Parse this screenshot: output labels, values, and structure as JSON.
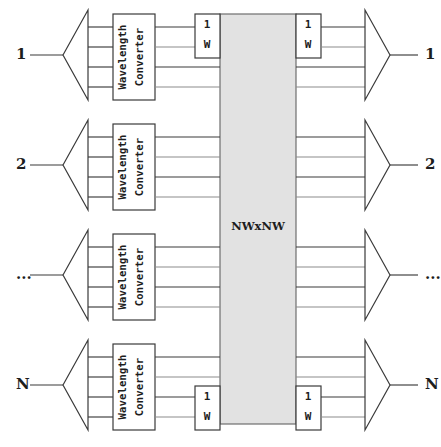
{
  "diagram": {
    "fabric": {
      "label": "NWxNW",
      "fill_color": "#e2e2e2",
      "stroke_color": "#6e6e6e"
    },
    "converter": {
      "line1": "Wavelength",
      "line2": "Converter"
    },
    "amplifier": {
      "line1": "1",
      "line2": "W"
    },
    "colors": {
      "wire": "#3a3a3a",
      "wire_light": "#8b8b8b",
      "text": "#1d1d1d",
      "background": "#ffffff"
    },
    "wavelengths_per_port": 4,
    "rows": [
      {
        "index": 0,
        "input_label": "1",
        "output_label": "1",
        "has_input_amplifier": true,
        "has_output_amplifier": true,
        "amplifier_position": "top"
      },
      {
        "index": 1,
        "input_label": "2",
        "output_label": "2",
        "has_input_amplifier": false,
        "has_output_amplifier": false,
        "amplifier_position": ""
      },
      {
        "index": 2,
        "input_label": "...",
        "output_label": "...",
        "has_input_amplifier": false,
        "has_output_amplifier": false,
        "amplifier_position": ""
      },
      {
        "index": 3,
        "input_label": "N",
        "output_label": "N",
        "has_input_amplifier": true,
        "has_output_amplifier": true,
        "amplifier_position": "bottom"
      }
    ]
  }
}
